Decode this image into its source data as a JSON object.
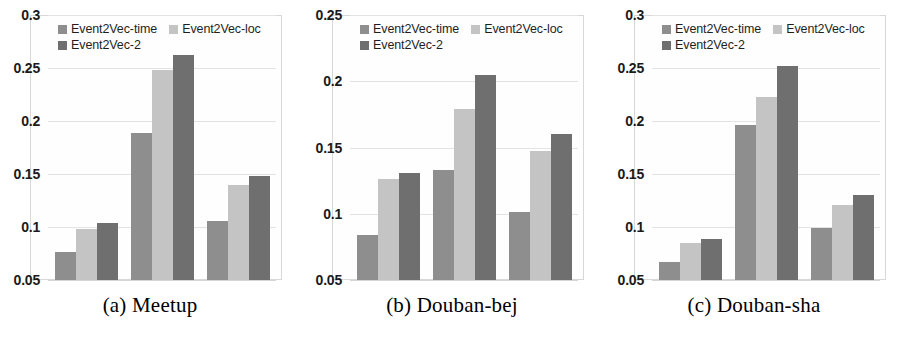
{
  "figure": {
    "series_names": [
      "Event2Vec-time",
      "Event2Vec-loc",
      "Event2Vec-2"
    ],
    "series_colors": [
      "#8e8e8e",
      "#c4c4c4",
      "#6f6f6f"
    ],
    "grid": true,
    "legend_position": "top-inside"
  },
  "panels": [
    {
      "caption": "(a) Meetup",
      "ticks": [
        "0.3",
        "0.25",
        "0.2",
        "0.15",
        "0.1",
        "0.05"
      ],
      "legend": [
        {
          "label": "Event2Vec-time",
          "color": "#8e8e8e"
        },
        {
          "label": "Event2Vec-loc",
          "color": "#c4c4c4"
        },
        {
          "label": "Event2Vec-2",
          "color": "#6f6f6f"
        }
      ],
      "chart_data": {
        "type": "bar",
        "title": "(a) Meetup",
        "xlabel": "",
        "ylabel": "",
        "ylim": [
          0.05,
          0.3
        ],
        "yticks": [
          0.05,
          0.1,
          0.15,
          0.2,
          0.25,
          0.3
        ],
        "categories": [
          "group-1",
          "group-2",
          "group-3"
        ],
        "series": [
          {
            "name": "Event2Vec-time",
            "values": [
              0.076,
              0.189,
              0.106
            ]
          },
          {
            "name": "Event2Vec-loc",
            "values": [
              0.098,
              0.248,
              0.14
            ]
          },
          {
            "name": "Event2Vec-2",
            "values": [
              0.104,
              0.262,
              0.148
            ]
          }
        ]
      }
    },
    {
      "caption": "(b) Douban-bej",
      "ticks": [
        "0.25",
        "0.2",
        "0.15",
        "0.1",
        "0.05"
      ],
      "legend": [
        {
          "label": "Event2Vec-time",
          "color": "#8e8e8e"
        },
        {
          "label": "Event2Vec-loc",
          "color": "#c4c4c4"
        },
        {
          "label": "Event2Vec-2",
          "color": "#6f6f6f"
        }
      ],
      "chart_data": {
        "type": "bar",
        "title": "(b) Douban-bej",
        "xlabel": "",
        "ylabel": "",
        "ylim": [
          0.05,
          0.25
        ],
        "yticks": [
          0.05,
          0.1,
          0.15,
          0.2,
          0.25
        ],
        "categories": [
          "group-1",
          "group-2",
          "group-3"
        ],
        "series": [
          {
            "name": "Event2Vec-time",
            "values": [
              0.084,
              0.133,
              0.101
            ]
          },
          {
            "name": "Event2Vec-loc",
            "values": [
              0.126,
              0.179,
              0.147
            ]
          },
          {
            "name": "Event2Vec-2",
            "values": [
              0.131,
              0.205,
              0.16
            ]
          }
        ]
      }
    },
    {
      "caption": "(c) Douban-sha",
      "ticks": [
        "0.3",
        "0.25",
        "0.2",
        "0.15",
        "0.1",
        "0.05"
      ],
      "legend": [
        {
          "label": "Event2Vec-time",
          "color": "#8e8e8e"
        },
        {
          "label": "Event2Vec-loc",
          "color": "#c4c4c4"
        },
        {
          "label": "Event2Vec-2",
          "color": "#6f6f6f"
        }
      ],
      "chart_data": {
        "type": "bar",
        "title": "(c) Douban-sha",
        "xlabel": "",
        "ylabel": "",
        "ylim": [
          0.05,
          0.3
        ],
        "yticks": [
          0.05,
          0.1,
          0.15,
          0.2,
          0.25,
          0.3
        ],
        "categories": [
          "group-1",
          "group-2",
          "group-3"
        ],
        "series": [
          {
            "name": "Event2Vec-time",
            "values": [
              0.067,
              0.196,
              0.099
            ]
          },
          {
            "name": "Event2Vec-loc",
            "values": [
              0.085,
              0.223,
              0.121
            ]
          },
          {
            "name": "Event2Vec-2",
            "values": [
              0.089,
              0.252,
              0.13
            ]
          }
        ]
      }
    }
  ]
}
